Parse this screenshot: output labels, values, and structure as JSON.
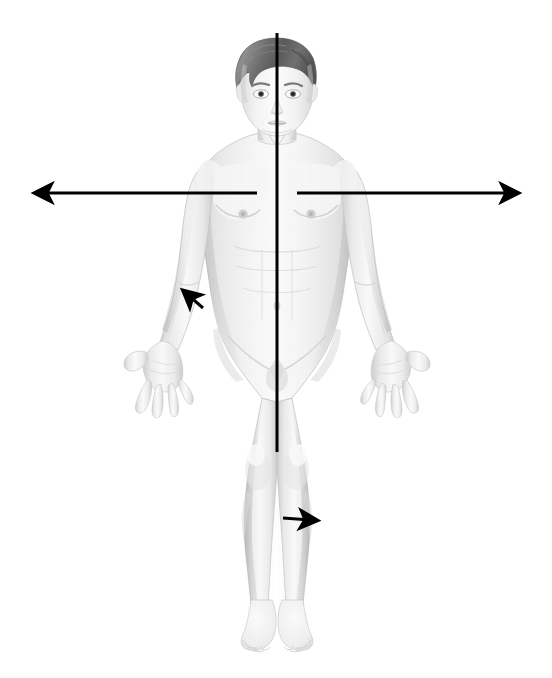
{
  "figure": {
    "background_color": "#ffffff",
    "line_color": "#000000",
    "skin_color": "#f2f2f2",
    "skin_shadow_color": "#d9d9d9",
    "hair_color": "#6b6b6b",
    "hair_dark_color": "#4a4a4a",
    "width": 552,
    "height": 678
  },
  "figure_body": {
    "name": "human-figure",
    "view": "anterior",
    "sex": "male",
    "pose": "standing, arms abducted, palms forward, fingers spread",
    "parts": [
      {
        "name": "head",
        "label": "Head"
      },
      {
        "name": "hair",
        "label": "Hair"
      },
      {
        "name": "face",
        "label": "Face"
      },
      {
        "name": "neck",
        "label": "Neck"
      },
      {
        "name": "torso",
        "label": "Torso"
      },
      {
        "name": "left-arm",
        "label": "Left arm"
      },
      {
        "name": "right-arm",
        "label": "Right arm"
      },
      {
        "name": "left-hand",
        "label": "Left hand"
      },
      {
        "name": "right-hand",
        "label": "Right hand"
      },
      {
        "name": "left-leg",
        "label": "Left leg"
      },
      {
        "name": "right-leg",
        "label": "Right leg"
      },
      {
        "name": "left-foot",
        "label": "Left foot"
      },
      {
        "name": "right-foot",
        "label": "Right foot"
      }
    ]
  },
  "annotations": {
    "vertical_line": {
      "name": "midsagittal-plane-line",
      "label": "Midsagittal plane",
      "x": 277,
      "y_start": 33,
      "y_end": 452,
      "stroke_width": 3,
      "color": "#000000",
      "has_arrowheads": false
    },
    "horizontal_line": {
      "name": "transverse-plane-line",
      "label": "Transverse plane",
      "y": 193,
      "x_start": 28,
      "x_end": 525,
      "gap_start": 257,
      "gap_end": 297,
      "stroke_width": 3,
      "color": "#000000",
      "has_arrowheads": true,
      "arrowhead_left_tip_x": 22,
      "arrowhead_right_tip_x": 530
    },
    "arrow_arm": {
      "name": "arm-direction-arrow",
      "label": "Arrow on left forearm pointing superolaterally",
      "from_x": 203,
      "from_y": 308,
      "to_x": 178,
      "to_y": 286,
      "stroke_width": 3,
      "color": "#000000"
    },
    "arrow_leg": {
      "name": "leg-direction-arrow",
      "label": "Arrow on right knee pointing laterally",
      "from_x": 283,
      "from_y": 518,
      "to_x": 324,
      "to_y": 521,
      "stroke_width": 3,
      "color": "#000000"
    }
  }
}
